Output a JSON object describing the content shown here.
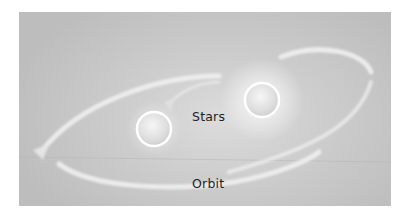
{
  "diagram": {
    "labels": {
      "stars": "Stars",
      "orbit": "Orbit"
    },
    "elements": {
      "stars": [
        {
          "name": "star-left",
          "cx": 154,
          "cy": 129,
          "r": 17
        },
        {
          "name": "star-right",
          "cx": 262,
          "cy": 100,
          "r": 17
        }
      ],
      "orbits": 2
    },
    "colors": {
      "background": "#c8c8c8",
      "orbit_stroke": "#ececec",
      "star_fill": "#e6e6e6",
      "star_rim": "#ffffff",
      "label_text": "#1e1e1e"
    }
  }
}
